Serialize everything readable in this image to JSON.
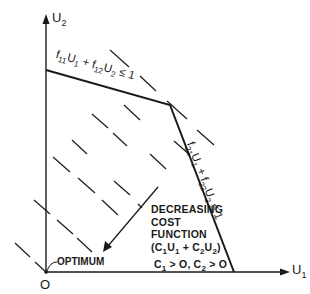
{
  "diagram": {
    "axes": {
      "y_label": "U",
      "y_label_sub": "2",
      "x_label": "U",
      "x_label_sub": "1",
      "origin_label": "O"
    },
    "constraints": [
      {
        "id": "c1",
        "parts": [
          "f",
          "11",
          "U",
          "1",
          " + f",
          "12",
          "U",
          "2",
          " ≤ 1"
        ]
      },
      {
        "id": "c2",
        "parts": [
          "f",
          "21",
          "U",
          "1",
          " + f",
          "22",
          "U",
          "2",
          " ≤ 1"
        ]
      }
    ],
    "cost": {
      "line1": "DECREASING",
      "line2": "COST",
      "line3": "FUNCTION",
      "line4_open": "(C",
      "line4_s1": "1",
      "line4_u1": "U",
      "line4_s2": "1",
      "line4_plus": " + C",
      "line4_s3": "2",
      "line4_u2": "U",
      "line4_s4": "2",
      "line4_close": ")",
      "line5_c1": "C",
      "line5_s1": "1",
      "line5_gt1": " > O,  C",
      "line5_s2": "2",
      "line5_gt2": " > O"
    },
    "optimum_label": "OPTIMUM",
    "colors": {
      "ink": "#1a1a1a",
      "background": "#ffffff"
    },
    "geometry": {
      "origin": [
        46,
        272
      ],
      "feasible_region_vertices": [
        [
          46,
          272
        ],
        [
          46,
          70
        ],
        [
          170,
          105
        ],
        [
          234,
          272
        ]
      ],
      "cost_contour_direction": "decreasing toward origin (lower-left)"
    }
  }
}
